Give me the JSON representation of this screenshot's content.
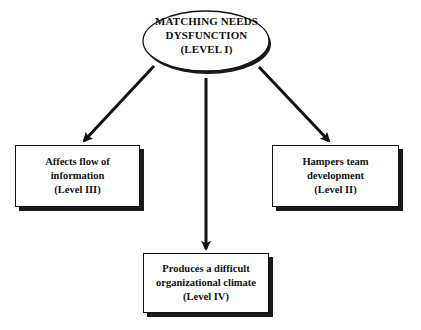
{
  "diagram": {
    "root": {
      "lines": [
        "MATCHING NEEDS",
        "DYSFUNCTION",
        "(LEVEL I)"
      ]
    },
    "nodes": [
      {
        "id": "left",
        "lines": [
          "Affects flow of",
          "information",
          "(Level III)"
        ]
      },
      {
        "id": "right",
        "lines": [
          "Hampers team",
          "development",
          "(Level II)"
        ]
      },
      {
        "id": "bottom",
        "lines": [
          "Produces a difficult",
          "organizational climate",
          "(Level IV)"
        ]
      }
    ],
    "edges": [
      {
        "from": "root",
        "to": "left"
      },
      {
        "from": "root",
        "to": "bottom"
      },
      {
        "from": "root",
        "to": "right"
      }
    ]
  }
}
